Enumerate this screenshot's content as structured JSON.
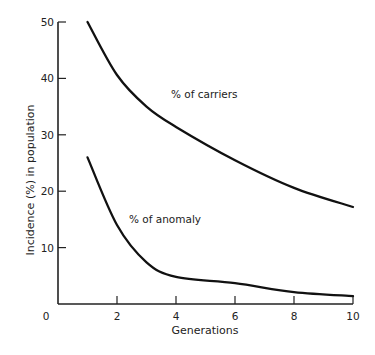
{
  "chart_data": {
    "type": "line",
    "title": "",
    "xlabel": "Generations",
    "ylabel": "Incidence (%) in population",
    "xlim": [
      0,
      10
    ],
    "ylim": [
      0,
      50
    ],
    "x_ticks": [
      0,
      2,
      4,
      6,
      8,
      10
    ],
    "y_ticks": [
      10,
      20,
      30,
      40,
      50
    ],
    "x_tick_labels": [
      "0",
      "2",
      "4",
      "6",
      "8",
      "10"
    ],
    "y_tick_labels": [
      "10",
      "20",
      "30",
      "40",
      "50"
    ],
    "grid": false,
    "legend": "none (inline curve labels)",
    "series": [
      {
        "name": "% of carriers",
        "x": [
          1,
          2,
          3,
          4,
          6,
          8,
          10
        ],
        "values": [
          50,
          40.6,
          35,
          31.4,
          25.5,
          20.6,
          17.2
        ]
      },
      {
        "name": "% of anomaly",
        "x": [
          1,
          2,
          3,
          4,
          6,
          8,
          10
        ],
        "values": [
          26,
          14,
          7.4,
          4.8,
          3.7,
          2.1,
          1.4
        ]
      }
    ],
    "annotations": [
      {
        "text": "% of carriers",
        "x": 5.6,
        "y": 37
      },
      {
        "text": "% of anomaly",
        "x": 4.0,
        "y": 15
      }
    ]
  }
}
